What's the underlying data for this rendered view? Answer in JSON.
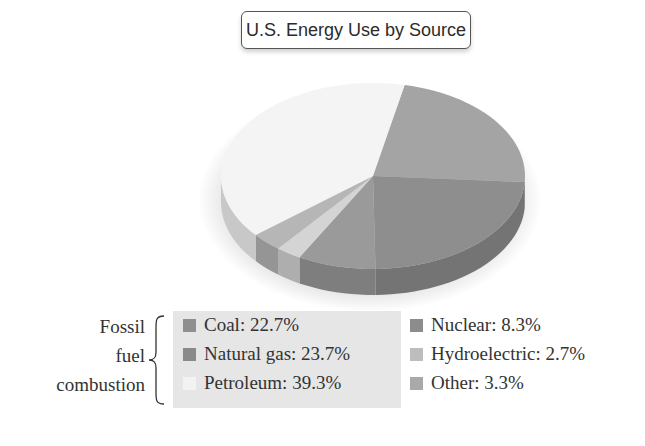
{
  "chart_data": {
    "type": "pie",
    "title": "U.S. Energy Use by Source",
    "style": "3d",
    "categories": [
      "Coal",
      "Natural gas",
      "Nuclear",
      "Hydroelectric",
      "Other",
      "Petroleum"
    ],
    "values": [
      22.7,
      23.7,
      8.3,
      2.7,
      3.3,
      39.3
    ],
    "unit": "%",
    "colors": {
      "Coal": "#a4a4a4",
      "Natural gas": "#8e8e8e",
      "Nuclear": "#9a9a9a",
      "Hydroelectric": "#d4d4d4",
      "Other": "#b6b6b6",
      "Petroleum": "#f4f4f4"
    },
    "legend": {
      "group_label": "Fossil fuel combustion",
      "group_members": [
        "Coal",
        "Natural gas",
        "Petroleum"
      ],
      "position": "bottom"
    }
  },
  "title": "U.S. Energy Use by Source",
  "group_label_lines": [
    "Fossil",
    "fuel",
    "combustion"
  ],
  "legend": {
    "fossil": [
      {
        "label": "Coal: 22.7%",
        "color": "#8f8f8f"
      },
      {
        "label": "Natural gas: 23.7%",
        "color": "#8a8a8a"
      },
      {
        "label": "Petroleum: 39.3%",
        "color": "#f2f2f2"
      }
    ],
    "other": [
      {
        "label": "Nuclear: 8.3%",
        "color": "#8c8c8c"
      },
      {
        "label": "Hydroelectric: 2.7%",
        "color": "#bdbdbd"
      },
      {
        "label": "Other: 3.3%",
        "color": "#a9a9a9"
      }
    ]
  }
}
